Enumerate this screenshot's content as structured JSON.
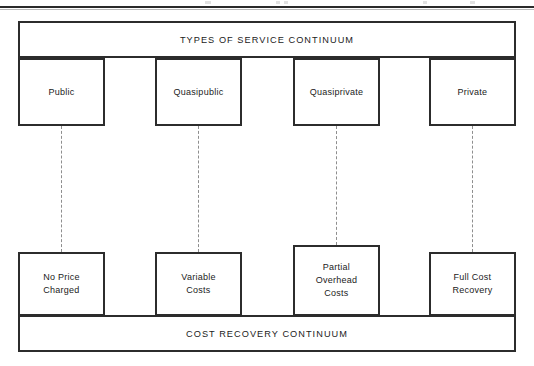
{
  "diagram": {
    "title_banner": "TYPES OF SERVICE CONTINUUM",
    "bottom_banner": "COST RECOVERY CONTINUUM",
    "service_types": [
      {
        "label": "Public"
      },
      {
        "label": "Quasipublic"
      },
      {
        "label": "Quasiprivate"
      },
      {
        "label": "Private"
      }
    ],
    "cost_recovery": [
      {
        "line1": "No Price",
        "line2": "Charged",
        "line3": ""
      },
      {
        "line1": "Variable",
        "line2": "Costs",
        "line3": ""
      },
      {
        "line1": "Partial",
        "line2": "Overhead",
        "line3": "Costs"
      },
      {
        "line1": "Full Cost",
        "line2": "Recovery",
        "line3": ""
      }
    ],
    "colors": {
      "line": "#2c2c2c",
      "text": "#1b1b1b",
      "connector": "#8e8e8e",
      "background": "#ffffff"
    }
  }
}
